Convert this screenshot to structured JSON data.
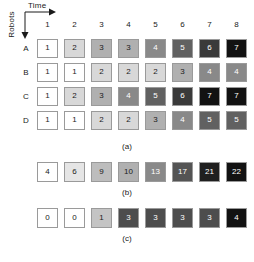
{
  "axes": {
    "x_label": "Time",
    "y_label": "Robots"
  },
  "chart_data": {
    "type": "heatmap",
    "title": "",
    "xlabel": "Time",
    "ylabel": "Robots",
    "grid": true,
    "legend": "none",
    "colormap": "grayscale-white-to-black",
    "panels": [
      {
        "caption": "(a)",
        "column_headers": [
          "1",
          "2",
          "3",
          "4",
          "5",
          "6",
          "7",
          "8"
        ],
        "row_labels": [
          "A",
          "B",
          "C",
          "D"
        ],
        "vmin": 1,
        "vmax": 7,
        "rows": [
          {
            "label": "A",
            "values": [
              1,
              2,
              3,
              3,
              4,
              5,
              6,
              7
            ]
          },
          {
            "label": "B",
            "values": [
              1,
              1,
              2,
              2,
              2,
              3,
              4,
              4
            ]
          },
          {
            "label": "C",
            "values": [
              1,
              2,
              3,
              4,
              5,
              6,
              7,
              7
            ]
          },
          {
            "label": "D",
            "values": [
              1,
              1,
              2,
              2,
              3,
              4,
              5,
              5
            ]
          }
        ]
      },
      {
        "caption": "(b)",
        "row_labels": [],
        "vmin": 4,
        "vmax": 22,
        "rows": [
          {
            "label": "",
            "values": [
              4,
              6,
              9,
              10,
              13,
              17,
              21,
              22
            ]
          }
        ]
      },
      {
        "caption": "(c)",
        "row_labels": [],
        "vmin": 0,
        "vmax": 4,
        "rows": [
          {
            "label": "",
            "values": [
              0,
              0,
              1,
              3,
              3,
              3,
              3,
              4
            ]
          }
        ]
      }
    ]
  },
  "captions": {
    "a": "(a)",
    "b": "(b)",
    "c": "(c)"
  },
  "colors": {
    "cell_border": "#9a9a9a",
    "text_dark": "#1a1a1a",
    "text_light": "#ffffff",
    "background": "#ffffff"
  }
}
